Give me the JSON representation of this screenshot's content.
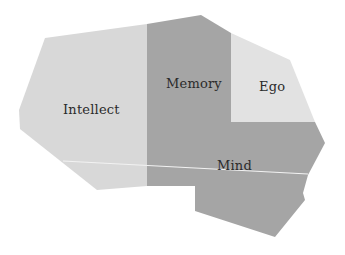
{
  "diagram": {
    "title": "",
    "background": "#ffffff",
    "colors": {
      "light_region": "#d8d8d8",
      "dark_region": "#a5a5a5",
      "ego_region": "#e2e2e2",
      "divider_line": "#f2f2f2",
      "label_text": "#2b2b2b"
    },
    "regions": [
      {
        "id": "intellect",
        "label": "Intellect",
        "fill": "#d8d8d8",
        "points": "45,38 147,24 147,186 97,190 20,129 19,110",
        "label_pos": {
          "x": 63,
          "y": 102
        }
      },
      {
        "id": "memory",
        "label": "Memory",
        "fill": "#a5a5a5",
        "points": "147,24 201,15 231,33 231,122 147,122",
        "label_pos": {
          "x": 166,
          "y": 76
        }
      },
      {
        "id": "ego",
        "label": "Ego",
        "fill": "#e2e2e2",
        "points": "231,33 290,60 315,122 231,122",
        "label_pos": {
          "x": 259,
          "y": 79
        }
      },
      {
        "id": "mind",
        "label": "Mind",
        "fill": "#a5a5a5",
        "points": "147,122 315,122 325,143 308,175 303,193 305,200 275,237 195,211 195,186 147,186",
        "label_pos": {
          "x": 217,
          "y": 158
        }
      }
    ],
    "divider": {
      "x1": 63,
      "y1": 161,
      "x2": 308,
      "y2": 174,
      "stroke": "#f2f2f2",
      "width": 1.2
    }
  }
}
